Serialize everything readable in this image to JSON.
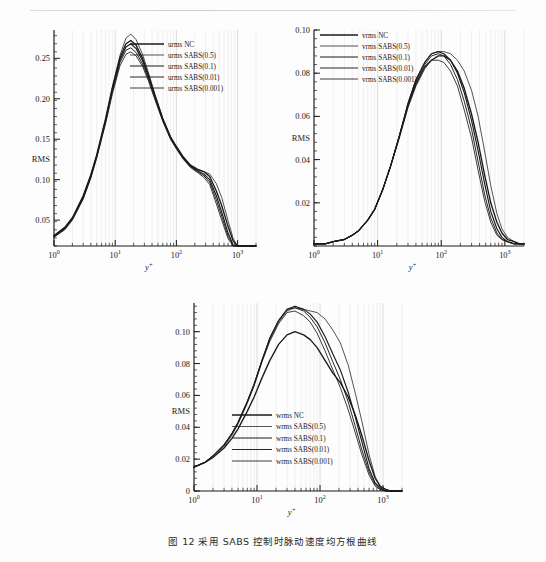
{
  "figure": {
    "caption": "图 12  采用 SABS 控制时脉动速度均方根曲线",
    "background": "#fdfdfd",
    "line_color": "#1a1a1a",
    "grid_color": "#d9d9d9"
  },
  "chart_data": [
    {
      "type": "line",
      "id": "urms",
      "title": "",
      "xlabel": "y+",
      "ylabel": "RMS",
      "xscale": "log",
      "xlim": [
        1,
        2000
      ],
      "ylim": [
        0.018,
        0.285
      ],
      "xticks": [
        "10^0",
        "10^1",
        "10^2",
        "10^3"
      ],
      "yticks": [
        "0.05",
        "0.10",
        "0.15",
        "0.20",
        "0.25"
      ],
      "ytick_values": [
        0.05,
        0.1,
        0.15,
        0.2,
        0.25
      ],
      "grid": true,
      "legend_position": "upper-right",
      "legend": [
        "urms NC",
        "urms SABS(0.5)",
        "urms SABS(0.1)",
        "urms SABS(0.01)",
        "urms SABS(0.001)"
      ],
      "x": [
        1,
        1.5,
        2,
        3,
        4,
        5,
        7,
        9,
        12,
        15,
        18,
        22,
        28,
        35,
        45,
        60,
        80,
        100,
        130,
        170,
        220,
        280,
        350,
        450,
        550,
        700,
        850,
        1000,
        1300,
        1700,
        2000
      ],
      "series": [
        {
          "name": "urms NC",
          "values": [
            0.031,
            0.041,
            0.053,
            0.08,
            0.106,
            0.131,
            0.176,
            0.214,
            0.251,
            0.268,
            0.272,
            0.266,
            0.25,
            0.229,
            0.203,
            0.175,
            0.153,
            0.141,
            0.128,
            0.118,
            0.113,
            0.11,
            0.104,
            0.086,
            0.068,
            0.042,
            0.024,
            0.014,
            0.006,
            0.003,
            0.002
          ]
        },
        {
          "name": "urms SABS(0.5)",
          "values": [
            0.03,
            0.04,
            0.052,
            0.079,
            0.105,
            0.13,
            0.175,
            0.214,
            0.254,
            0.275,
            0.28,
            0.273,
            0.255,
            0.232,
            0.205,
            0.176,
            0.153,
            0.14,
            0.127,
            0.117,
            0.112,
            0.11,
            0.107,
            0.095,
            0.078,
            0.049,
            0.027,
            0.015,
            0.006,
            0.003,
            0.002
          ]
        },
        {
          "name": "urms SABS(0.1)",
          "values": [
            0.03,
            0.04,
            0.052,
            0.078,
            0.104,
            0.129,
            0.173,
            0.211,
            0.248,
            0.264,
            0.268,
            0.262,
            0.247,
            0.227,
            0.202,
            0.174,
            0.152,
            0.14,
            0.127,
            0.117,
            0.111,
            0.107,
            0.1,
            0.08,
            0.06,
            0.034,
            0.019,
            0.011,
            0.005,
            0.002,
            0.002
          ]
        },
        {
          "name": "urms SABS(0.01)",
          "values": [
            0.029,
            0.039,
            0.051,
            0.077,
            0.103,
            0.128,
            0.172,
            0.209,
            0.245,
            0.26,
            0.263,
            0.257,
            0.243,
            0.224,
            0.2,
            0.173,
            0.151,
            0.139,
            0.126,
            0.116,
            0.11,
            0.105,
            0.097,
            0.075,
            0.055,
            0.03,
            0.017,
            0.01,
            0.004,
            0.002,
            0.002
          ]
        },
        {
          "name": "urms SABS(0.001)",
          "values": [
            0.029,
            0.038,
            0.05,
            0.076,
            0.102,
            0.127,
            0.17,
            0.206,
            0.241,
            0.255,
            0.258,
            0.253,
            0.24,
            0.222,
            0.198,
            0.172,
            0.15,
            0.138,
            0.125,
            0.115,
            0.109,
            0.103,
            0.094,
            0.07,
            0.05,
            0.027,
            0.015,
            0.009,
            0.004,
            0.002,
            0.002
          ]
        }
      ]
    },
    {
      "type": "line",
      "id": "vrms",
      "title": "",
      "xlabel": "y+",
      "ylabel": "RMS",
      "xscale": "log",
      "xlim": [
        1,
        2000
      ],
      "ylim": [
        0,
        0.1
      ],
      "xticks": [
        "10^0",
        "10^1",
        "10^2",
        "10^3"
      ],
      "yticks": [
        "0.02",
        "0.04",
        "0.06",
        "0.08",
        "0.10"
      ],
      "ytick_values": [
        0.02,
        0.04,
        0.06,
        0.08,
        0.1
      ],
      "grid": true,
      "legend_position": "upper-left",
      "legend": [
        "vrms NC",
        "vrms SABS(0.5)",
        "vrms SABS(0.1)",
        "vrms SABS(0.01)",
        "vrms SABS(0.001)"
      ],
      "x": [
        1,
        1.5,
        2,
        3,
        4,
        5,
        7,
        9,
        12,
        16,
        22,
        30,
        40,
        55,
        70,
        90,
        110,
        140,
        180,
        230,
        300,
        380,
        480,
        600,
        750,
        900,
        1100,
        1400,
        1700,
        2000
      ],
      "series": [
        {
          "name": "vrms NC",
          "values": [
            0.001,
            0.001,
            0.002,
            0.003,
            0.005,
            0.007,
            0.012,
            0.017,
            0.026,
            0.037,
            0.051,
            0.065,
            0.075,
            0.083,
            0.086,
            0.088,
            0.088,
            0.086,
            0.081,
            0.073,
            0.061,
            0.048,
            0.033,
            0.02,
            0.011,
            0.006,
            0.003,
            0.002,
            0.001,
            0.001
          ]
        },
        {
          "name": "vrms SABS(0.5)",
          "values": [
            0.001,
            0.001,
            0.002,
            0.003,
            0.005,
            0.007,
            0.012,
            0.017,
            0.026,
            0.037,
            0.051,
            0.066,
            0.077,
            0.085,
            0.089,
            0.09,
            0.09,
            0.089,
            0.086,
            0.081,
            0.072,
            0.06,
            0.044,
            0.028,
            0.015,
            0.008,
            0.004,
            0.002,
            0.001,
            0.001
          ]
        },
        {
          "name": "vrms SABS(0.1)",
          "values": [
            0.001,
            0.001,
            0.002,
            0.003,
            0.005,
            0.007,
            0.012,
            0.017,
            0.026,
            0.037,
            0.051,
            0.066,
            0.077,
            0.085,
            0.089,
            0.09,
            0.089,
            0.086,
            0.08,
            0.071,
            0.058,
            0.044,
            0.029,
            0.016,
            0.008,
            0.004,
            0.002,
            0.001,
            0.001,
            0.001
          ]
        },
        {
          "name": "vrms SABS(0.01)",
          "values": [
            0.001,
            0.001,
            0.002,
            0.003,
            0.005,
            0.007,
            0.012,
            0.017,
            0.026,
            0.037,
            0.051,
            0.065,
            0.076,
            0.084,
            0.088,
            0.089,
            0.088,
            0.084,
            0.077,
            0.067,
            0.054,
            0.039,
            0.024,
            0.013,
            0.006,
            0.003,
            0.002,
            0.001,
            0.001,
            0.001
          ]
        },
        {
          "name": "vrms SABS(0.001)",
          "values": [
            0.001,
            0.001,
            0.002,
            0.003,
            0.005,
            0.007,
            0.012,
            0.017,
            0.026,
            0.037,
            0.05,
            0.064,
            0.074,
            0.082,
            0.086,
            0.086,
            0.085,
            0.081,
            0.074,
            0.063,
            0.05,
            0.035,
            0.021,
            0.011,
            0.005,
            0.003,
            0.002,
            0.001,
            0.001,
            0.001
          ]
        }
      ]
    },
    {
      "type": "line",
      "id": "wrms",
      "title": "",
      "xlabel": "y+",
      "ylabel": "RMS",
      "xscale": "log",
      "xlim": [
        1,
        2000
      ],
      "ylim": [
        0,
        0.118
      ],
      "xticks": [
        "10^0",
        "10^1",
        "10^2",
        "10^3"
      ],
      "yticks": [
        "0",
        "0.02",
        "0.04",
        "0.06",
        "0.08",
        "0.10"
      ],
      "ytick_values": [
        0,
        0.02,
        0.04,
        0.06,
        0.08,
        0.1
      ],
      "grid": true,
      "legend_position": "lower-center",
      "legend": [
        "wrms NC",
        "wrms SABS(0.5)",
        "wrms SABS(0.1)",
        "wrms SABS(0.01)",
        "wrms SABS(0.001)"
      ],
      "x": [
        1,
        1.5,
        2,
        3,
        4,
        5,
        7,
        9,
        12,
        16,
        22,
        30,
        40,
        55,
        70,
        90,
        120,
        160,
        210,
        280,
        360,
        460,
        600,
        750,
        900,
        1100,
        1300,
        1600,
        2000
      ],
      "series": [
        {
          "name": "wrms NC",
          "values": [
            0.015,
            0.018,
            0.021,
            0.027,
            0.033,
            0.039,
            0.05,
            0.059,
            0.071,
            0.082,
            0.092,
            0.098,
            0.1,
            0.098,
            0.095,
            0.09,
            0.082,
            0.074,
            0.068,
            0.059,
            0.048,
            0.035,
            0.019,
            0.008,
            0.003,
            0.001,
            0.0,
            0.0,
            0.0
          ]
        },
        {
          "name": "wrms SABS(0.5)",
          "values": [
            0.015,
            0.018,
            0.022,
            0.029,
            0.036,
            0.043,
            0.056,
            0.067,
            0.082,
            0.095,
            0.106,
            0.113,
            0.115,
            0.114,
            0.113,
            0.112,
            0.108,
            0.101,
            0.093,
            0.079,
            0.062,
            0.044,
            0.023,
            0.009,
            0.003,
            0.001,
            0.0,
            0.0,
            0.0
          ]
        },
        {
          "name": "wrms SABS(0.1)",
          "values": [
            0.015,
            0.018,
            0.022,
            0.029,
            0.036,
            0.043,
            0.056,
            0.067,
            0.082,
            0.096,
            0.107,
            0.114,
            0.116,
            0.114,
            0.111,
            0.106,
            0.097,
            0.086,
            0.076,
            0.062,
            0.047,
            0.031,
            0.014,
            0.005,
            0.002,
            0.0,
            0.0,
            0.0,
            0.0
          ]
        },
        {
          "name": "wrms SABS(0.01)",
          "values": [
            0.015,
            0.018,
            0.022,
            0.029,
            0.036,
            0.043,
            0.056,
            0.067,
            0.082,
            0.096,
            0.107,
            0.114,
            0.115,
            0.113,
            0.109,
            0.103,
            0.093,
            0.081,
            0.07,
            0.056,
            0.041,
            0.026,
            0.012,
            0.004,
            0.001,
            0.0,
            0.0,
            0.0,
            0.0
          ]
        },
        {
          "name": "wrms SABS(0.001)",
          "values": [
            0.015,
            0.018,
            0.022,
            0.028,
            0.035,
            0.042,
            0.055,
            0.066,
            0.081,
            0.094,
            0.105,
            0.112,
            0.113,
            0.11,
            0.106,
            0.099,
            0.088,
            0.076,
            0.065,
            0.051,
            0.037,
            0.023,
            0.01,
            0.003,
            0.001,
            0.0,
            0.0,
            0.0,
            0.0
          ]
        }
      ]
    }
  ]
}
